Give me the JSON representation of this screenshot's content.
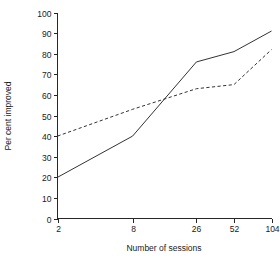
{
  "chart_data": {
    "type": "line",
    "title": "",
    "xlabel": "Number of sessions",
    "ylabel": "Per cent improved",
    "x": [
      2,
      8,
      26,
      52,
      104
    ],
    "xtick_labels": [
      "2",
      "8",
      "26",
      "52",
      "104"
    ],
    "ytick_labels": [
      "0",
      "10",
      "20",
      "30",
      "40",
      "50",
      "60",
      "70",
      "80",
      "90",
      "100"
    ],
    "ytick_values": [
      0,
      10,
      20,
      30,
      40,
      50,
      60,
      70,
      80,
      90,
      100
    ],
    "ylim": [
      0,
      100
    ],
    "xlim": [
      2,
      104
    ],
    "x_scale": "log",
    "grid": false,
    "legend": "none",
    "series": [
      {
        "name": "solid-series",
        "style": "solid",
        "color": "#333333",
        "values": [
          20,
          40,
          76,
          81,
          91
        ]
      },
      {
        "name": "dashed-series",
        "style": "dashed",
        "color": "#333333",
        "values": [
          40,
          53,
          63,
          65,
          82
        ]
      }
    ]
  },
  "axes": {
    "y_title": "Per cent improved",
    "x_title": "Number of sessions"
  },
  "ticks": {
    "y": [
      {
        "label": "100",
        "value": 100
      },
      {
        "label": "90",
        "value": 90
      },
      {
        "label": "80",
        "value": 80
      },
      {
        "label": "70",
        "value": 70
      },
      {
        "label": "60",
        "value": 60
      },
      {
        "label": "50",
        "value": 50
      },
      {
        "label": "40",
        "value": 40
      },
      {
        "label": "30",
        "value": 30
      },
      {
        "label": "20",
        "value": 20
      },
      {
        "label": "10",
        "value": 10
      },
      {
        "label": "0",
        "value": 0
      }
    ],
    "x": [
      {
        "label": "2",
        "value": 2
      },
      {
        "label": "8",
        "value": 8
      },
      {
        "label": "26",
        "value": 26
      },
      {
        "label": "52",
        "value": 52
      },
      {
        "label": "104",
        "value": 104
      }
    ]
  }
}
